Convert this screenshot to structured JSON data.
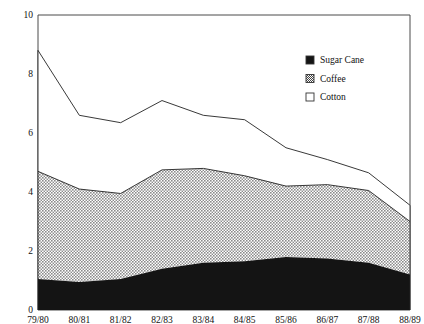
{
  "chart_data": {
    "type": "area",
    "title": "",
    "subtitle": "",
    "xlabel": "",
    "ylabel": "",
    "stacked": true,
    "grid": false,
    "legend_position": "top-right",
    "categories": [
      "79/80",
      "80/81",
      "81/82",
      "82/83",
      "83/84",
      "84/85",
      "85/86",
      "86/87",
      "87/88",
      "88/89"
    ],
    "ylim": [
      0,
      10
    ],
    "yticks": [
      0,
      2,
      4,
      6,
      8,
      10
    ],
    "ytick_labels": [
      "0",
      "2",
      "4",
      "6",
      "8",
      "10"
    ],
    "series": [
      {
        "name": "Sugar Cane",
        "fill": "solid-black",
        "color": "#141414",
        "values": [
          1.05,
          0.95,
          1.05,
          1.4,
          1.6,
          1.65,
          1.8,
          1.75,
          1.6,
          1.2
        ]
      },
      {
        "name": "Coffee",
        "fill": "crosshatch",
        "color": "#b4b4b4",
        "values": [
          3.65,
          3.15,
          2.9,
          3.35,
          3.2,
          2.9,
          2.4,
          2.5,
          2.45,
          1.8
        ]
      },
      {
        "name": "Cotton",
        "fill": "white",
        "color": "#ffffff",
        "values": [
          4.1,
          2.5,
          2.4,
          2.35,
          1.8,
          1.9,
          1.3,
          0.85,
          0.6,
          0.55
        ]
      }
    ],
    "cumulative_tops": {
      "sugar_cane": [
        1.05,
        0.95,
        1.05,
        1.4,
        1.6,
        1.65,
        1.8,
        1.75,
        1.6,
        1.2
      ],
      "coffee": [
        4.7,
        4.1,
        3.95,
        4.75,
        4.8,
        4.55,
        4.2,
        4.25,
        4.05,
        3.0
      ],
      "total": [
        8.8,
        6.6,
        6.35,
        7.1,
        6.6,
        6.45,
        5.5,
        5.1,
        4.65,
        3.55
      ]
    }
  },
  "legend": {
    "items": [
      {
        "label": "Sugar Cane",
        "swatch": "solid-black-swatch"
      },
      {
        "label": "Coffee",
        "swatch": "crosshatch-swatch"
      },
      {
        "label": "Cotton",
        "swatch": "empty-swatch"
      }
    ]
  },
  "colors": {
    "sugar_cane": "#141414",
    "coffee": "#b4b4b4",
    "cotton": "#ffffff",
    "axis": "#4a4a4a",
    "line": "#222222",
    "text": "#111111"
  }
}
